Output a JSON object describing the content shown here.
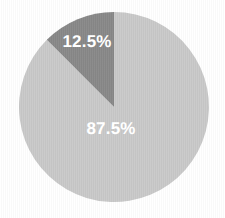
{
  "chart_data": {
    "type": "pie",
    "title": "",
    "subtitle": "",
    "xlabel": "",
    "ylabel": "",
    "legend": "none",
    "grid": false,
    "start_angle_deg": 0,
    "direction": "counterclockwise",
    "categories": [
      "Minor segment",
      "Major segment"
    ],
    "values": [
      12.5,
      87.5
    ],
    "labels": [
      "12.5%",
      "87.5%"
    ],
    "colors": [
      "#888888",
      "#c9c9c9"
    ],
    "label_color": "#ffffff",
    "background_color": "#ffffff",
    "slices": [
      {
        "label": "12.5%",
        "value": 12.5,
        "color": "#888888",
        "sweep_deg": 45,
        "start_deg": 315,
        "end_deg": 360
      },
      {
        "label": "87.5%",
        "value": 87.5,
        "color": "#c9c9c9",
        "sweep_deg": 315,
        "start_deg": 0,
        "end_deg": 315
      }
    ],
    "geometry": {
      "center_x": 114,
      "center_y": 107,
      "radius": 95
    }
  }
}
